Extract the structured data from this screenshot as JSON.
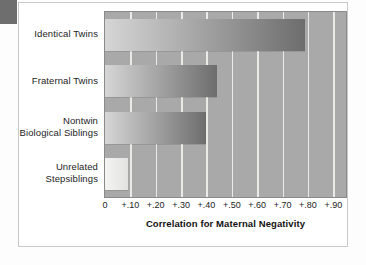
{
  "figure": {
    "corner_tab": "page-corner-tab"
  },
  "chart_data": {
    "type": "bar",
    "orientation": "horizontal",
    "title": "",
    "xlabel": "Correlation for Maternal Negativity",
    "ylabel": "",
    "categories": [
      "Identical Twins",
      "Fraternal Twins",
      "Nontwin\nBiological Siblings",
      "Unrelated\nStepsiblings"
    ],
    "values": [
      0.79,
      0.44,
      0.4,
      0.09
    ],
    "xlim": [
      0,
      0.95
    ],
    "xticks": [
      0,
      0.1,
      0.2,
      0.3,
      0.4,
      0.5,
      0.6,
      0.7,
      0.8,
      0.9
    ],
    "xticklabels": [
      "0",
      "+.10",
      "+.20",
      "+.30",
      "+.40",
      "+.50",
      "+.60",
      "+.70",
      "+.80",
      "+.90"
    ],
    "grid": "vertical-white-gridlines",
    "legend": "none",
    "colors": {
      "plot_background": "#a9a9a9",
      "gridline": "#eceae6",
      "bar_gradient_start": "#d6d6d6",
      "bar_gradient_end": "#6d6d6d",
      "bar_light_start": "#f4f4f2",
      "bar_light_end": "#e2e2e0",
      "text": "#1d1d1d",
      "panel_background": "#ffffff",
      "corner_tab": "#6e6e6e"
    }
  }
}
